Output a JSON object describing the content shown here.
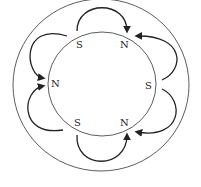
{
  "diagram": {
    "type": "magnetic-field-rotor",
    "poles": [
      {
        "label": "S",
        "x": 80,
        "y": 48
      },
      {
        "label": "N",
        "x": 124,
        "y": 48
      },
      {
        "label": "N",
        "x": 55,
        "y": 87
      },
      {
        "label": "S",
        "x": 148,
        "y": 89
      },
      {
        "label": "S",
        "x": 78,
        "y": 126
      },
      {
        "label": "N",
        "x": 124,
        "y": 126
      }
    ],
    "colors": {
      "stroke": "#222222",
      "background": "#ffffff"
    }
  }
}
